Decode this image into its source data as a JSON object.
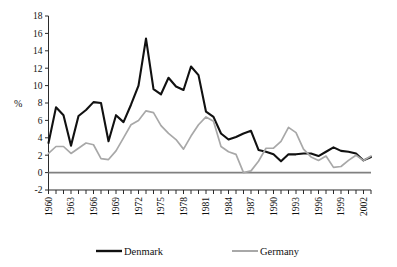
{
  "chart_data": {
    "type": "line",
    "title": "",
    "xlabel": "",
    "ylabel": "%",
    "ylim": [
      -2,
      18
    ],
    "ytick_step": 2,
    "yticks": [
      18,
      16,
      14,
      12,
      10,
      8,
      6,
      4,
      2,
      0,
      -2
    ],
    "xlim": [
      1960,
      2003
    ],
    "xticks_labeled": [
      1960,
      1963,
      1966,
      1969,
      1972,
      1975,
      1978,
      1981,
      1984,
      1987,
      1990,
      1993,
      1996,
      1999,
      2002
    ],
    "x": [
      1960,
      1961,
      1962,
      1963,
      1964,
      1965,
      1966,
      1967,
      1968,
      1969,
      1970,
      1971,
      1972,
      1973,
      1974,
      1975,
      1976,
      1977,
      1978,
      1979,
      1980,
      1981,
      1982,
      1983,
      1984,
      1985,
      1986,
      1987,
      1988,
      1989,
      1990,
      1991,
      1992,
      1993,
      1994,
      1995,
      1996,
      1997,
      1998,
      1999,
      2000,
      2001,
      2002,
      2003
    ],
    "grid": false,
    "legend_position": "bottom",
    "series": [
      {
        "name": "Denmark",
        "color": "#111111",
        "values": [
          3.4,
          7.5,
          6.6,
          3.1,
          6.5,
          7.2,
          8.1,
          8.0,
          3.6,
          6.6,
          5.8,
          7.8,
          10.0,
          15.4,
          9.6,
          9.0,
          10.9,
          9.9,
          9.5,
          12.2,
          11.2,
          7.0,
          6.4,
          4.5,
          3.8,
          4.1,
          4.5,
          4.8,
          2.6,
          2.4,
          2.1,
          1.3,
          2.1,
          2.1,
          2.2,
          2.2,
          1.9,
          2.4,
          2.9,
          2.5,
          2.4,
          2.2,
          1.4,
          1.8
        ]
      },
      {
        "name": "Germany",
        "color": "#a8a8a8",
        "values": [
          2.2,
          3.0,
          3.0,
          2.2,
          2.8,
          3.4,
          3.2,
          1.6,
          1.5,
          2.5,
          4.0,
          5.5,
          6.0,
          7.1,
          6.9,
          5.4,
          4.5,
          3.8,
          2.7,
          4.2,
          5.5,
          6.4,
          5.9,
          3.0,
          2.4,
          2.1,
          0.0,
          0.2,
          1.3,
          2.8,
          2.8,
          3.6,
          5.2,
          4.6,
          2.7,
          1.8,
          1.4,
          1.9,
          0.6,
          0.7,
          1.4,
          2.0,
          1.4,
          1.9
        ]
      }
    ],
    "legend": [
      {
        "label": "Denmark",
        "color": "#111111"
      },
      {
        "label": "Germany",
        "color": "#a8a8a8"
      }
    ]
  }
}
